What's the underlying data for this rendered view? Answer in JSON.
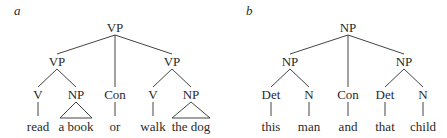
{
  "panels": [
    {
      "label": "a",
      "tree": {
        "root": "VP",
        "left": {
          "label": "VP",
          "children": [
            {
              "label": "V",
              "word": "read"
            },
            {
              "label": "NP",
              "word": "a book",
              "triangle": true
            }
          ]
        },
        "middle": {
          "label": "Con",
          "word": "or"
        },
        "right": {
          "label": "VP",
          "children": [
            {
              "label": "V",
              "word": "walk"
            },
            {
              "label": "NP",
              "word": "the dog",
              "triangle": true
            }
          ]
        }
      },
      "nodes": {
        "root": "VP",
        "l": "VP",
        "r": "VP",
        "ll": "V",
        "lr": "NP",
        "m": "Con",
        "rl": "V",
        "rr": "NP"
      },
      "words": {
        "ll": "read",
        "lr": "a book",
        "m": "or",
        "rl": "walk",
        "rr": "the dog"
      }
    },
    {
      "label": "b",
      "tree": {
        "root": "NP",
        "left": {
          "label": "NP",
          "children": [
            {
              "label": "Det",
              "word": "this"
            },
            {
              "label": "N",
              "word": "man"
            }
          ]
        },
        "middle": {
          "label": "Con",
          "word": "and"
        },
        "right": {
          "label": "NP",
          "children": [
            {
              "label": "Det",
              "word": "that"
            },
            {
              "label": "N",
              "word": "child"
            }
          ]
        }
      },
      "nodes": {
        "root": "NP",
        "l": "NP",
        "r": "NP",
        "ll": "Det",
        "lr": "N",
        "m": "Con",
        "rl": "Det",
        "rr": "N"
      },
      "words": {
        "ll": "this",
        "lr": "man",
        "m": "and",
        "rl": "that",
        "rr": "child"
      }
    }
  ]
}
